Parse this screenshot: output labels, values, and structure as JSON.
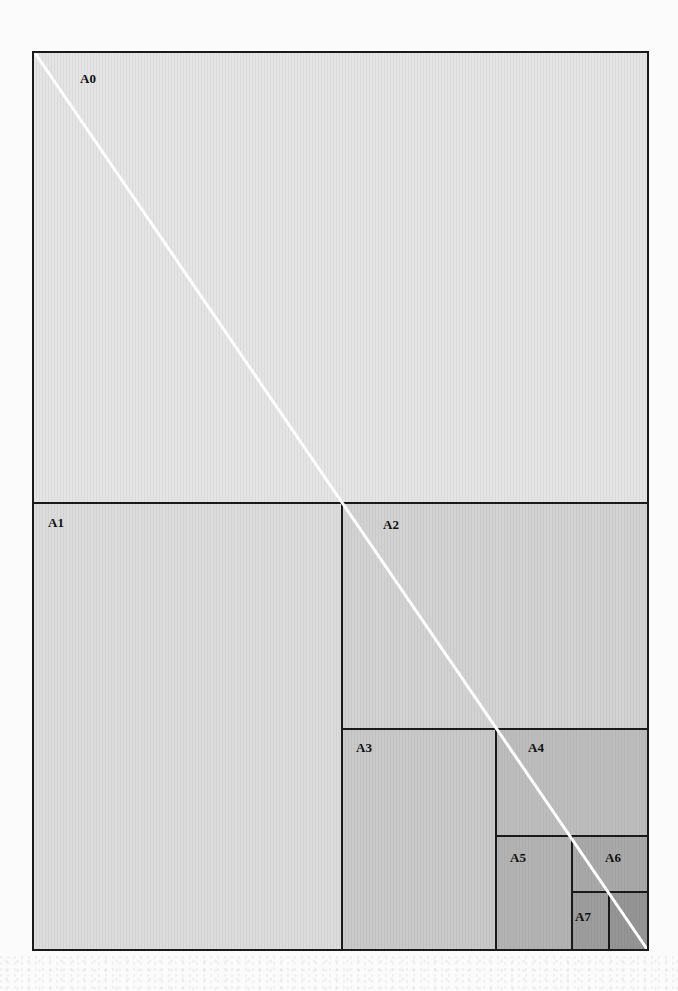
{
  "diagram": {
    "title": "",
    "outer": {
      "x": 33,
      "y": 52,
      "w": 615,
      "h": 898
    },
    "regions": [
      {
        "id": "A0",
        "label": "A0",
        "x": 33,
        "y": 52,
        "w": 615,
        "h": 451,
        "fill": "#e4e4e4",
        "label_x": 80,
        "label_y": 72
      },
      {
        "id": "A1",
        "label": "A1",
        "x": 33,
        "y": 503,
        "w": 309,
        "h": 447,
        "fill": "#dcdcdc",
        "label_x": 48,
        "label_y": 516
      },
      {
        "id": "A2",
        "label": "A2",
        "x": 342,
        "y": 503,
        "w": 306,
        "h": 226,
        "fill": "#d2d2d2",
        "label_x": 383,
        "label_y": 518
      },
      {
        "id": "A3",
        "label": "A3",
        "x": 342,
        "y": 729,
        "w": 154,
        "h": 221,
        "fill": "#c9c9c9",
        "label_x": 356,
        "label_y": 741
      },
      {
        "id": "A4",
        "label": "A4",
        "x": 496,
        "y": 729,
        "w": 152,
        "h": 107,
        "fill": "#bdbdbd",
        "label_x": 528,
        "label_y": 741
      },
      {
        "id": "A5",
        "label": "A5",
        "x": 496,
        "y": 836,
        "w": 76,
        "h": 114,
        "fill": "#b3b3b3",
        "label_x": 510,
        "label_y": 851
      },
      {
        "id": "A6",
        "label": "A6",
        "x": 572,
        "y": 836,
        "w": 76,
        "h": 56,
        "fill": "#a9a9a9",
        "label_x": 605,
        "label_y": 851
      },
      {
        "id": "A7",
        "label": "A7",
        "x": 572,
        "y": 892,
        "w": 37,
        "h": 58,
        "fill": "#9d9d9d",
        "label_x": 575,
        "label_y": 910
      },
      {
        "id": "A8",
        "label": "",
        "x": 609,
        "y": 892,
        "w": 39,
        "h": 58,
        "fill": "#959595",
        "label_x": 0,
        "label_y": 0
      }
    ],
    "diagonal": {
      "x1": 35,
      "y1": 53,
      "x2": 647,
      "y2": 949,
      "color": "#ffffff",
      "width": 3
    },
    "labels": {
      "A0": "A0",
      "A1": "A1",
      "A2": "A2",
      "A3": "A3",
      "A4": "A4",
      "A5": "A5",
      "A6": "A6",
      "A7": "A7"
    }
  }
}
